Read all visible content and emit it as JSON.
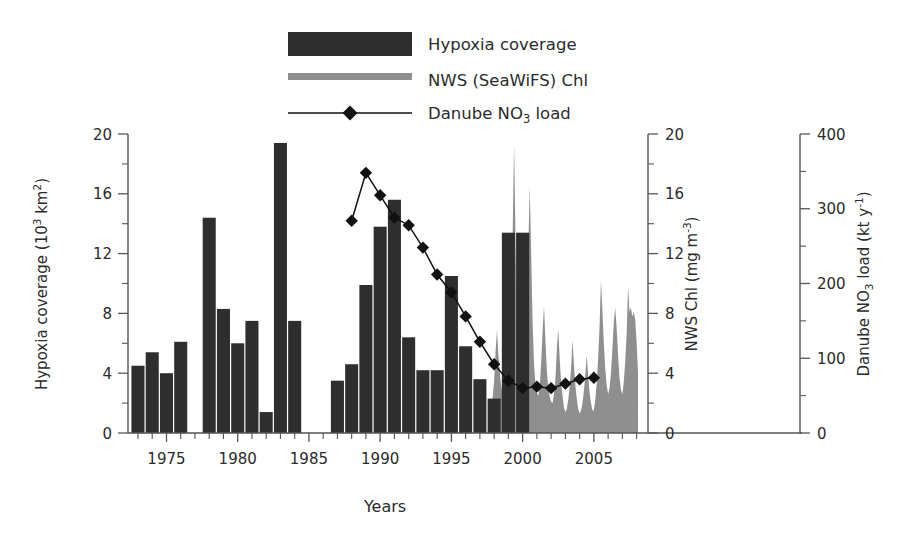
{
  "legend": {
    "position": "top-center",
    "items": [
      {
        "label": "Hypoxia coverage",
        "type": "bar",
        "color": "#2e2e2e",
        "name": "legend-hypoxia"
      },
      {
        "label": "NWS (SeaWiFS) Chl",
        "type": "line-thick",
        "color": "#8f8f8f",
        "name": "legend-chl"
      },
      {
        "label": "Danube NO3 load",
        "type": "line-marker",
        "color": "#111111",
        "name": "legend-danube"
      }
    ]
  },
  "axes": {
    "x": {
      "label": "Years",
      "ticks": [
        1975,
        1980,
        1985,
        1990,
        1995,
        2000,
        2005
      ],
      "ticklabels": [
        "1975",
        "1980",
        "1985",
        "1990",
        "1995",
        "2000",
        "2005"
      ],
      "range": [
        1972.3,
        2008.8
      ],
      "minor_step": 1
    },
    "y_left": {
      "label_main": "Hypoxia coverage (10",
      "label_sup": "3",
      "label_tail": " km",
      "label_sup2": "2",
      "label_close": ")",
      "label_plain": "Hypoxia coverage (10^3 km^2)",
      "ticks": [
        0,
        4,
        8,
        12,
        16,
        20
      ],
      "ticklabels": [
        "0",
        "4",
        "8",
        "12",
        "16",
        "20"
      ],
      "range": [
        0,
        20
      ],
      "minor_step": 2
    },
    "y_mid": {
      "label_plain": "NWS Chl (mg m^-3)",
      "label_main": "NWS Chl (mg m",
      "label_sup": "-3",
      "label_close": ")",
      "ticks": [
        0,
        4,
        8,
        12,
        16,
        20
      ],
      "ticklabels": [
        "0",
        "4",
        "8",
        "12",
        "16",
        "20"
      ],
      "range": [
        0,
        20
      ],
      "minor_step": 2
    },
    "y_right": {
      "label_plain": "Danube NO3 load (kt y^-1)",
      "label_a": "Danube NO",
      "label_sub": "3",
      "label_b": " load (kt y",
      "label_sup": "-1",
      "label_close": ")",
      "ticks": [
        0,
        100,
        200,
        300,
        400
      ],
      "ticklabels": [
        "0",
        "100",
        "200",
        "300",
        "400"
      ],
      "range": [
        0,
        400
      ],
      "minor_step": 50
    }
  },
  "chart_data": {
    "type": "bar",
    "title": "",
    "xlabel": "Years",
    "ylabel": "Hypoxia coverage (10^3 km^2)",
    "grid": false,
    "legend_position": "top-center",
    "xlim": [
      1972.3,
      2008.8
    ],
    "ylim": [
      0,
      20
    ],
    "series": [
      {
        "name": "Hypoxia coverage",
        "type": "bar",
        "axis": "y_left",
        "unit": "10^3 km^2",
        "color": "#2e2e2e",
        "x": [
          1973,
          1974,
          1975,
          1976,
          1978,
          1979,
          1980,
          1981,
          1982,
          1983,
          1984,
          1987,
          1988,
          1989,
          1990,
          1991,
          1992,
          1993,
          1994,
          1995,
          1996,
          1997,
          1998,
          1999,
          2000
        ],
        "values": [
          4.5,
          5.4,
          4.0,
          6.1,
          14.4,
          8.3,
          6.0,
          7.5,
          1.4,
          19.4,
          7.5,
          3.5,
          4.6,
          9.9,
          13.8,
          15.6,
          6.4,
          4.2,
          4.2,
          10.5,
          5.8,
          3.6,
          2.3,
          13.4,
          13.4
        ]
      },
      {
        "name": "NWS (SeaWiFS) Chl",
        "type": "line",
        "axis": "y_mid",
        "unit": "mg m^-3",
        "color": "#8f8f8f",
        "x": [
          1997.8,
          1997.9,
          1998.0,
          1998.1,
          1998.2,
          1998.3,
          1998.4,
          1998.5,
          1998.6,
          1998.7,
          1998.8,
          1998.9,
          1999.0,
          1999.1,
          1999.2,
          1999.3,
          1999.4,
          1999.5,
          1999.6,
          1999.7,
          1999.8,
          1999.9,
          2000.0,
          2000.1,
          2000.2,
          2000.3,
          2000.4,
          2000.5,
          2000.6,
          2000.7,
          2000.8,
          2000.9,
          2001.0,
          2001.1,
          2001.2,
          2001.3,
          2001.4,
          2001.5,
          2001.6,
          2001.7,
          2001.8,
          2001.9,
          2002.0,
          2002.1,
          2002.2,
          2002.3,
          2002.4,
          2002.5,
          2002.6,
          2002.7,
          2002.8,
          2002.9,
          2003.0,
          2003.1,
          2003.2,
          2003.3,
          2003.4,
          2003.5,
          2003.6,
          2003.7,
          2003.8,
          2003.9,
          2004.0,
          2004.1,
          2004.2,
          2004.3,
          2004.4,
          2004.5,
          2004.6,
          2004.7,
          2004.8,
          2004.9,
          2005.0,
          2005.1,
          2005.2,
          2005.3,
          2005.4,
          2005.5,
          2005.6,
          2005.7,
          2005.8,
          2005.9,
          2006.0,
          2006.1,
          2006.2,
          2006.3,
          2006.4,
          2006.5,
          2006.6,
          2006.7,
          2006.8,
          2006.9,
          2007.0,
          2007.1,
          2007.2,
          2007.3,
          2007.4,
          2007.5,
          2007.6,
          2007.7,
          2007.8,
          2007.9,
          2008.0,
          2008.1
        ],
        "values": [
          1.8,
          2.4,
          3.5,
          5.4,
          6.9,
          5.2,
          4.0,
          3.1,
          2.6,
          2.2,
          2.0,
          2.3,
          3.2,
          5.8,
          9.6,
          13.3,
          19.4,
          13.0,
          7.0,
          4.4,
          3.2,
          2.6,
          2.4,
          3.0,
          5.0,
          8.4,
          12.3,
          16.5,
          12.0,
          7.4,
          4.6,
          3.3,
          2.7,
          2.5,
          3.1,
          4.7,
          6.8,
          8.5,
          6.2,
          4.2,
          3.0,
          2.4,
          2.1,
          2.0,
          2.6,
          3.6,
          5.6,
          7.0,
          5.0,
          3.4,
          2.5,
          1.7,
          1.4,
          1.6,
          2.2,
          3.1,
          4.3,
          6.2,
          4.6,
          3.2,
          2.3,
          1.6,
          1.3,
          1.5,
          2.0,
          2.8,
          3.9,
          5.2,
          3.8,
          2.7,
          2.0,
          1.5,
          1.5,
          2.2,
          3.3,
          5.0,
          7.1,
          10.2,
          8.2,
          6.0,
          4.3,
          3.2,
          2.6,
          3.0,
          4.0,
          5.6,
          7.4,
          8.4,
          7.0,
          5.2,
          3.7,
          2.9,
          2.6,
          3.4,
          4.8,
          6.6,
          9.8,
          8.1,
          8.4,
          7.8,
          8.1,
          7.6,
          6.1,
          4.0
        ]
      },
      {
        "name": "Danube NO3 load",
        "type": "line-marker",
        "axis": "y_right",
        "unit": "kt y^-1",
        "color": "#111111",
        "x": [
          1988,
          1989,
          1990,
          1991,
          1992,
          1993,
          1994,
          1995,
          1996,
          1997,
          1998,
          1999,
          2000,
          2001,
          2002,
          2003,
          2004,
          2005
        ],
        "values": [
          284,
          348,
          318,
          288,
          278,
          248,
          212,
          188,
          156,
          122,
          92,
          70,
          60,
          62,
          60,
          66,
          72,
          74
        ]
      }
    ]
  }
}
